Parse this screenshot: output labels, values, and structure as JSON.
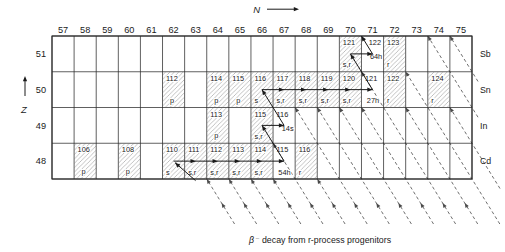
{
  "figure": {
    "caption_beta": "β⁻",
    "caption_rest": "decay from r-process progenitors",
    "x_axis_label": "N",
    "y_axis_label": "Z"
  },
  "columns": [
    "57",
    "58",
    "59",
    "60",
    "61",
    "62",
    "63",
    "64",
    "65",
    "66",
    "67",
    "68",
    "69",
    "70",
    "71",
    "72",
    "73",
    "74",
    "75"
  ],
  "rows": [
    {
      "z": "51",
      "element": "Sb"
    },
    {
      "z": "50",
      "element": "Sn"
    },
    {
      "z": "49",
      "element": "In"
    },
    {
      "z": "48",
      "element": "Cd"
    }
  ],
  "colors": {
    "ink": "#1a1a1a",
    "grid": "#2b2b2b",
    "hatch": "#8f8f8f",
    "dash": "#4a4a4a"
  },
  "nuclides": [
    {
      "id": "Sb-121",
      "z": 51,
      "n": 70,
      "mass": "121",
      "tag": "s,r",
      "tag_style": "left",
      "hatched": true
    },
    {
      "id": "Sb-122",
      "z": 51,
      "n": 71,
      "mass": "122",
      "tag": "64h",
      "tag_style": "mid",
      "hatched": false,
      "mass_align": "right"
    },
    {
      "id": "Sb-123",
      "z": 51,
      "n": 72,
      "mass": "123",
      "tag": "r",
      "tag_style": "left",
      "hatched": true
    },
    {
      "id": "Sn-112",
      "z": 50,
      "n": 62,
      "mass": "112",
      "tag": "p",
      "tag_style": "center",
      "hatched": true
    },
    {
      "id": "Sn-114",
      "z": 50,
      "n": 64,
      "mass": "114",
      "tag": "p",
      "tag_style": "center",
      "hatched": true
    },
    {
      "id": "Sn-115",
      "z": 50,
      "n": 65,
      "mass": "115",
      "tag": "p",
      "tag_style": "center",
      "hatched": true
    },
    {
      "id": "Sn-116",
      "z": 50,
      "n": 66,
      "mass": "116",
      "tag": "s",
      "tag_style": "left",
      "hatched": true
    },
    {
      "id": "Sn-117",
      "z": 50,
      "n": 67,
      "mass": "117",
      "tag": "s,r",
      "tag_style": "left",
      "hatched": true
    },
    {
      "id": "Sn-118",
      "z": 50,
      "n": 68,
      "mass": "118",
      "tag": "s,r",
      "tag_style": "left",
      "hatched": true
    },
    {
      "id": "Sn-119",
      "z": 50,
      "n": 69,
      "mass": "119",
      "tag": "s,r",
      "tag_style": "left",
      "hatched": true
    },
    {
      "id": "Sn-120",
      "z": 50,
      "n": 70,
      "mass": "120",
      "tag": "s,r",
      "tag_style": "left",
      "hatched": true
    },
    {
      "id": "Sn-121",
      "z": 50,
      "n": 71,
      "mass": "121",
      "tag": "27h",
      "tag_style": "bottom",
      "hatched": false
    },
    {
      "id": "Sn-122",
      "z": 50,
      "n": 72,
      "mass": "122",
      "tag": "r",
      "tag_style": "left",
      "hatched": true
    },
    {
      "id": "Sn-124",
      "z": 50,
      "n": 74,
      "mass": "124",
      "tag": "r",
      "tag_style": "left",
      "hatched": true
    },
    {
      "id": "In-113",
      "z": 49,
      "n": 64,
      "mass": "113",
      "tag": "p",
      "tag_style": "center",
      "hatched": true
    },
    {
      "id": "In-115",
      "z": 49,
      "n": 66,
      "mass": "115",
      "tag": "s,r",
      "tag_style": "left",
      "hatched": true
    },
    {
      "id": "In-116",
      "z": 49,
      "n": 67,
      "mass": "116",
      "tag": "14s",
      "tag_style": "mid",
      "hatched": false
    },
    {
      "id": "Cd-106",
      "z": 48,
      "n": 58,
      "mass": "106",
      "tag": "p",
      "tag_style": "center",
      "hatched": true
    },
    {
      "id": "Cd-108",
      "z": 48,
      "n": 60,
      "mass": "108",
      "tag": "p",
      "tag_style": "center",
      "hatched": true
    },
    {
      "id": "Cd-110",
      "z": 48,
      "n": 62,
      "mass": "110",
      "tag": "s",
      "tag_style": "left",
      "hatched": true
    },
    {
      "id": "Cd-111",
      "z": 48,
      "n": 63,
      "mass": "111",
      "tag": "s,r",
      "tag_style": "left",
      "hatched": true
    },
    {
      "id": "Cd-112",
      "z": 48,
      "n": 64,
      "mass": "112",
      "tag": "s,r",
      "tag_style": "left",
      "hatched": true
    },
    {
      "id": "Cd-113",
      "z": 48,
      "n": 65,
      "mass": "113",
      "tag": "s,r",
      "tag_style": "left",
      "hatched": true
    },
    {
      "id": "Cd-114",
      "z": 48,
      "n": 66,
      "mass": "114",
      "tag": "s,r",
      "tag_style": "left",
      "hatched": true
    },
    {
      "id": "Cd-115",
      "z": 48,
      "n": 67,
      "mass": "115",
      "tag": "54h",
      "tag_style": "bottom",
      "hatched": false
    },
    {
      "id": "Cd-116",
      "z": 48,
      "n": 68,
      "mass": "116",
      "tag": "r",
      "tag_style": "left",
      "hatched": true
    }
  ],
  "s_process_path": {
    "entry_arrow": {
      "to": {
        "z": 48,
        "n": 62
      }
    },
    "segments": [
      {
        "kind": "capture",
        "z": 48,
        "n_from": 62,
        "n_to": 67
      },
      {
        "kind": "beta",
        "from": {
          "z": 48,
          "n": 67
        },
        "to": {
          "z": 49,
          "n": 66
        }
      },
      {
        "kind": "capture",
        "z": 49,
        "n_from": 66,
        "n_to": 67
      },
      {
        "kind": "beta",
        "from": {
          "z": 49,
          "n": 67
        },
        "to": {
          "z": 50,
          "n": 66
        }
      },
      {
        "kind": "capture",
        "z": 50,
        "n_from": 66,
        "n_to": 71
      },
      {
        "kind": "beta",
        "from": {
          "z": 50,
          "n": 71
        },
        "to": {
          "z": 51,
          "n": 70
        }
      },
      {
        "kind": "capture",
        "z": 51,
        "n_from": 70,
        "n_to": 71
      },
      {
        "kind": "beta_exit",
        "from": {
          "z": 51,
          "n": 71
        }
      }
    ]
  },
  "r_decay_lines": [
    {
      "a": 111,
      "end": {
        "z": 48,
        "n": 63
      }
    },
    {
      "a": 112,
      "end": {
        "z": 48,
        "n": 64
      }
    },
    {
      "a": 113,
      "end": {
        "z": 48,
        "n": 65
      }
    },
    {
      "a": 114,
      "end": {
        "z": 48,
        "n": 66
      }
    },
    {
      "a": 115,
      "end": {
        "z": 49,
        "n": 66
      }
    },
    {
      "a": 116,
      "end": {
        "z": 48,
        "n": 68
      }
    },
    {
      "a": 117,
      "end": {
        "z": 50,
        "n": 67
      }
    },
    {
      "a": 118,
      "end": {
        "z": 50,
        "n": 68
      }
    },
    {
      "a": 119,
      "end": {
        "z": 50,
        "n": 69
      }
    },
    {
      "a": 120,
      "end": {
        "z": 50,
        "n": 70
      }
    },
    {
      "a": 121,
      "end": {
        "z": 51,
        "n": 70
      }
    },
    {
      "a": 122,
      "end": {
        "z": 50,
        "n": 72
      }
    },
    {
      "a": 123,
      "end": {
        "z": 51,
        "n": 72
      }
    },
    {
      "a": 124,
      "end": {
        "z": 50,
        "n": 74
      }
    },
    {
      "a": 125,
      "end": null
    },
    {
      "a": 126,
      "end": null
    }
  ]
}
